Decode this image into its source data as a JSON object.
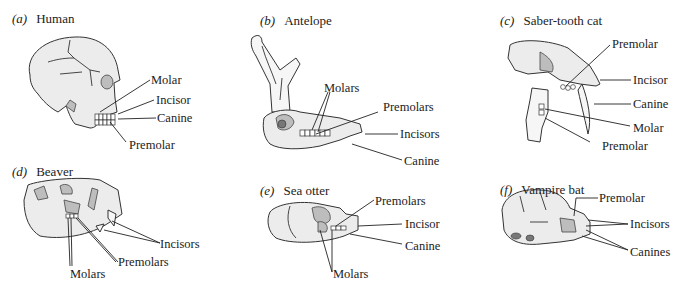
{
  "figure": {
    "panels": [
      {
        "id": "a",
        "letter": "(a)",
        "name": "Human",
        "labels": [
          "Molar",
          "Incisor",
          "Canine",
          "Premolar"
        ]
      },
      {
        "id": "b",
        "letter": "(b)",
        "name": "Antelope",
        "labels": [
          "Molars",
          "Premolars",
          "Incisors",
          "Canine"
        ]
      },
      {
        "id": "c",
        "letter": "(c)",
        "name": "Saber-tooth cat",
        "labels": [
          "Premolar",
          "Incisor",
          "Canine",
          "Molar",
          "Premolar"
        ]
      },
      {
        "id": "d",
        "letter": "(d)",
        "name": "Beaver",
        "labels": [
          "Incisors",
          "Premolars",
          "Molars"
        ]
      },
      {
        "id": "e",
        "letter": "(e)",
        "name": "Sea otter",
        "labels": [
          "Premolars",
          "Incisor",
          "Canine",
          "Molars"
        ]
      },
      {
        "id": "f",
        "letter": "(f)",
        "name": "Vampire bat",
        "labels": [
          "Premolar",
          "Incisors",
          "Canines"
        ]
      }
    ]
  }
}
